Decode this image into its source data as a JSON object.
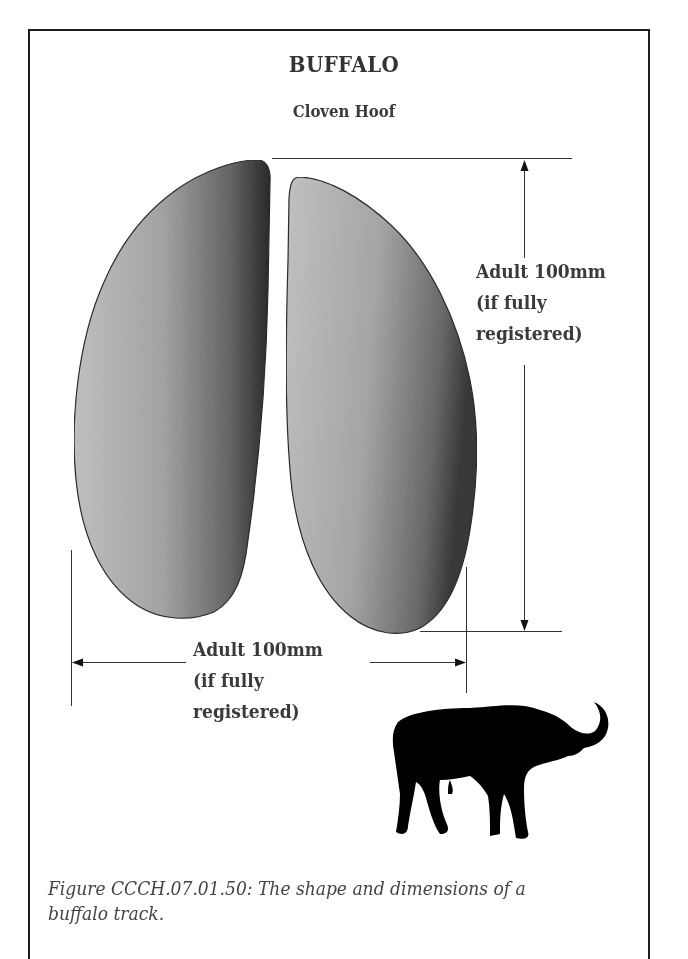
{
  "figure": {
    "title": "BUFFALO",
    "subtitle": "Cloven Hoof",
    "track_type": "cloven-hoof",
    "hooves": [
      {
        "side": "left",
        "shading": "gradient light-to-dark toward inner edge"
      },
      {
        "side": "right",
        "shading": "gradient light-to-dark toward outer edge"
      }
    ],
    "dimensions": {
      "length": {
        "orientation": "vertical",
        "lines": [
          "Adult 100mm",
          "(if fully",
          "registered)"
        ]
      },
      "width": {
        "orientation": "horizontal",
        "lines": [
          "Adult 100mm",
          "(if fully",
          "registered)"
        ]
      }
    },
    "silhouette": "buffalo-silhouette",
    "caption": "Figure CCCH.07.01.50:  The shape and dimensions of a buffalo track."
  },
  "colors": {
    "frame_border": "#1e1e1e",
    "text": "#3a3a3a",
    "hoof_light": "#bdbdbd",
    "hoof_dark": "#2e2e2e",
    "silhouette": "#000000"
  }
}
